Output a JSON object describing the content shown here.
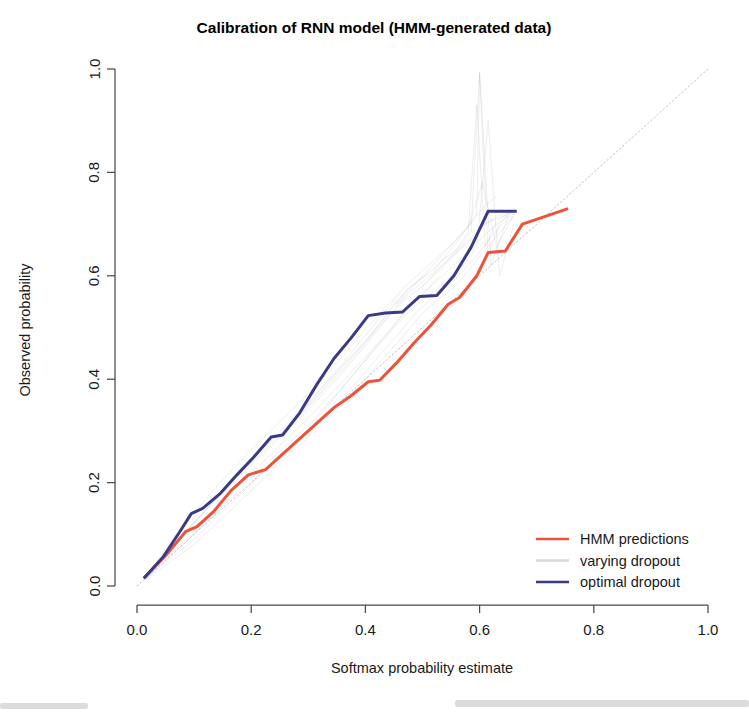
{
  "figure": {
    "title": "Calibration of RNN model (HMM-generated data)",
    "width": 749,
    "height": 716
  },
  "colors": {
    "hmm": "#ED5338",
    "optimal": "#3B3B85",
    "varying": "#9a9aa5",
    "reference": "#b9b9c4",
    "axis": "#4a4a4a",
    "text": "#1a1a1a"
  },
  "legend": {
    "position": "bottom-right",
    "items": [
      {
        "label": "HMM predictions",
        "color": "#ED5338",
        "style": "solid"
      },
      {
        "label": "varying dropout",
        "color": "#d8d8de",
        "style": "solid"
      },
      {
        "label": "optimal dropout",
        "color": "#3B3B85",
        "style": "solid"
      }
    ]
  },
  "chart_data": {
    "type": "line",
    "title": "Calibration of RNN model (HMM-generated data)",
    "xlabel": "Softmax probability estimate",
    "ylabel": "Observed probability",
    "xlim": [
      0.0,
      1.0
    ],
    "ylim": [
      0.0,
      1.0
    ],
    "xticks": [
      "0.0",
      "0.2",
      "0.4",
      "0.6",
      "0.8",
      "1.0"
    ],
    "xtick_values": [
      0.0,
      0.2,
      0.4,
      0.6,
      0.8,
      1.0
    ],
    "yticks": [
      "0.0",
      "0.2",
      "0.4",
      "0.6",
      "0.8",
      "1.0"
    ],
    "ytick_values": [
      0.0,
      0.2,
      0.4,
      0.6,
      0.8,
      1.0
    ],
    "grid": false,
    "reference_line": {
      "name": "perfect calibration (y = x)",
      "style": "dotted",
      "x": [
        0.0,
        1.0
      ],
      "y": [
        0.0,
        1.0
      ]
    },
    "series": [
      {
        "name": "HMM predictions",
        "color": "#ED5338",
        "width": 3.0,
        "x": [
          0.012,
          0.055,
          0.085,
          0.105,
          0.135,
          0.165,
          0.195,
          0.225,
          0.255,
          0.285,
          0.315,
          0.345,
          0.375,
          0.405,
          0.425,
          0.455,
          0.485,
          0.515,
          0.545,
          0.565,
          0.595,
          0.615,
          0.645,
          0.675,
          0.755
        ],
        "y": [
          0.015,
          0.065,
          0.105,
          0.115,
          0.145,
          0.185,
          0.215,
          0.225,
          0.255,
          0.285,
          0.315,
          0.345,
          0.368,
          0.395,
          0.398,
          0.432,
          0.47,
          0.505,
          0.545,
          0.558,
          0.6,
          0.645,
          0.648,
          0.7,
          0.73
        ]
      },
      {
        "name": "optimal dropout",
        "color": "#3B3B85",
        "width": 3.0,
        "x": [
          0.012,
          0.045,
          0.075,
          0.095,
          0.115,
          0.145,
          0.175,
          0.205,
          0.235,
          0.255,
          0.285,
          0.315,
          0.345,
          0.375,
          0.405,
          0.435,
          0.465,
          0.495,
          0.525,
          0.555,
          0.585,
          0.615,
          0.645,
          0.665
        ],
        "y": [
          0.015,
          0.055,
          0.105,
          0.14,
          0.15,
          0.178,
          0.215,
          0.25,
          0.288,
          0.292,
          0.335,
          0.39,
          0.44,
          0.48,
          0.523,
          0.528,
          0.53,
          0.56,
          0.562,
          0.6,
          0.655,
          0.725,
          0.725,
          0.725
        ]
      }
    ],
    "varying_dropout_runs": [
      {
        "x": [
          0.015,
          0.08,
          0.15,
          0.22,
          0.29,
          0.35,
          0.4,
          0.44,
          0.47,
          0.5,
          0.53,
          0.56,
          0.59,
          0.61,
          0.63,
          0.66
        ],
        "y": [
          0.018,
          0.1,
          0.18,
          0.255,
          0.33,
          0.4,
          0.465,
          0.52,
          0.555,
          0.58,
          0.61,
          0.645,
          0.68,
          0.7,
          0.715,
          0.725
        ]
      },
      {
        "x": [
          0.015,
          0.09,
          0.16,
          0.23,
          0.3,
          0.36,
          0.41,
          0.45,
          0.48,
          0.51,
          0.54,
          0.565,
          0.59,
          0.605,
          0.625,
          0.655
        ],
        "y": [
          0.015,
          0.095,
          0.175,
          0.25,
          0.325,
          0.395,
          0.455,
          0.505,
          0.545,
          0.575,
          0.605,
          0.63,
          0.66,
          0.675,
          0.695,
          0.72
        ]
      },
      {
        "x": [
          0.015,
          0.085,
          0.155,
          0.225,
          0.295,
          0.355,
          0.405,
          0.445,
          0.475,
          0.505,
          0.535,
          0.565,
          0.585,
          0.6,
          0.62,
          0.65
        ],
        "y": [
          0.02,
          0.105,
          0.19,
          0.27,
          0.35,
          0.42,
          0.48,
          0.535,
          0.575,
          0.6,
          0.63,
          0.655,
          0.685,
          0.995,
          0.62,
          0.715
        ]
      },
      {
        "x": [
          0.015,
          0.09,
          0.165,
          0.235,
          0.305,
          0.36,
          0.41,
          0.45,
          0.485,
          0.515,
          0.545,
          0.575,
          0.595,
          0.615,
          0.635,
          0.66
        ],
        "y": [
          0.012,
          0.09,
          0.17,
          0.245,
          0.315,
          0.385,
          0.45,
          0.5,
          0.54,
          0.565,
          0.595,
          0.625,
          0.655,
          0.9,
          0.6,
          0.7
        ]
      },
      {
        "x": [
          0.015,
          0.075,
          0.145,
          0.215,
          0.285,
          0.345,
          0.395,
          0.44,
          0.47,
          0.5,
          0.525,
          0.55,
          0.58,
          0.605,
          0.63,
          0.665
        ],
        "y": [
          0.018,
          0.11,
          0.2,
          0.28,
          0.355,
          0.425,
          0.49,
          0.545,
          0.58,
          0.61,
          0.635,
          0.66,
          0.695,
          0.78,
          0.655,
          0.73
        ]
      },
      {
        "x": [
          0.015,
          0.095,
          0.17,
          0.24,
          0.31,
          0.37,
          0.42,
          0.46,
          0.49,
          0.52,
          0.55,
          0.575,
          0.6,
          0.62,
          0.64,
          0.665
        ],
        "y": [
          0.015,
          0.085,
          0.165,
          0.24,
          0.31,
          0.375,
          0.44,
          0.49,
          0.53,
          0.56,
          0.585,
          0.615,
          0.645,
          0.675,
          0.7,
          0.725
        ]
      },
      {
        "x": [
          0.015,
          0.082,
          0.152,
          0.222,
          0.292,
          0.352,
          0.402,
          0.442,
          0.472,
          0.502,
          0.532,
          0.562,
          0.588,
          0.608,
          0.628,
          0.658
        ],
        "y": [
          0.02,
          0.1,
          0.185,
          0.262,
          0.338,
          0.408,
          0.472,
          0.525,
          0.562,
          0.59,
          0.618,
          0.648,
          0.672,
          0.7,
          0.71,
          0.722
        ]
      },
      {
        "x": [
          0.015,
          0.1,
          0.175,
          0.245,
          0.315,
          0.375,
          0.425,
          0.465,
          0.495,
          0.525,
          0.555,
          0.58,
          0.6,
          0.618,
          0.638,
          0.662
        ],
        "y": [
          0.012,
          0.08,
          0.158,
          0.232,
          0.302,
          0.368,
          0.432,
          0.482,
          0.522,
          0.552,
          0.578,
          0.608,
          0.638,
          0.66,
          0.688,
          0.718
        ]
      },
      {
        "x": [
          0.3,
          0.33,
          0.36,
          0.39,
          0.42,
          0.45,
          0.48,
          0.51
        ],
        "y": [
          0.35,
          0.385,
          0.425,
          0.46,
          0.5,
          0.545,
          0.58,
          0.605
        ]
      },
      {
        "x": [
          0.32,
          0.35,
          0.38,
          0.41,
          0.44,
          0.47,
          0.5,
          0.53
        ],
        "y": [
          0.33,
          0.37,
          0.41,
          0.45,
          0.49,
          0.53,
          0.565,
          0.6
        ]
      },
      {
        "x": [
          0.25,
          0.28,
          0.31,
          0.34,
          0.37,
          0.4,
          0.43,
          0.46
        ],
        "y": [
          0.285,
          0.325,
          0.365,
          0.405,
          0.445,
          0.485,
          0.525,
          0.565
        ]
      },
      {
        "x": [
          0.52,
          0.545,
          0.57,
          0.595,
          0.6,
          0.615,
          0.635,
          0.655
        ],
        "y": [
          0.61,
          0.645,
          0.68,
          0.72,
          0.99,
          0.64,
          0.7,
          0.725
        ]
      },
      {
        "x": [
          0.5,
          0.53,
          0.56,
          0.58,
          0.595,
          0.61,
          0.63,
          0.66
        ],
        "y": [
          0.58,
          0.615,
          0.65,
          0.685,
          0.93,
          0.655,
          0.705,
          0.728
        ]
      },
      {
        "x": [
          0.455,
          0.48,
          0.505,
          0.53,
          0.555,
          0.58,
          0.605,
          0.63
        ],
        "y": [
          0.545,
          0.575,
          0.605,
          0.635,
          0.665,
          0.695,
          0.73,
          0.755
        ]
      }
    ]
  }
}
